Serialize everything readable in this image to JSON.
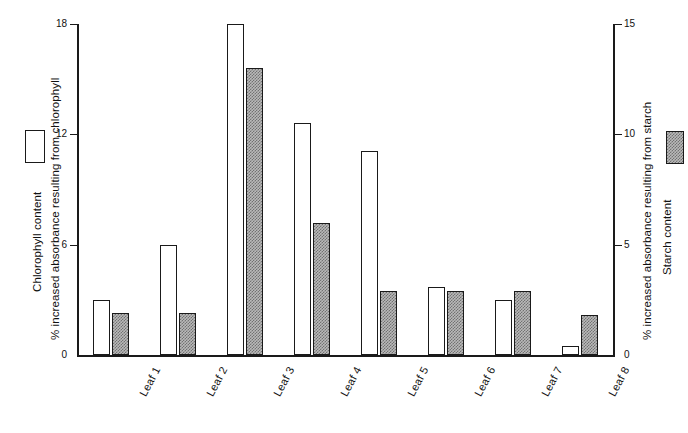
{
  "chart_data": {
    "type": "bar",
    "title": "",
    "categories": [
      "Leaf 1",
      "Leaf 2",
      "Leaf 3",
      "Leaf 4",
      "Leaf 5",
      "Leaf 6",
      "Leaf 7",
      "Leaf 8"
    ],
    "series": [
      {
        "name": "Chlorophyll content",
        "axis": "left",
        "style": "open-white-bar",
        "values": [
          3.0,
          6.0,
          18.0,
          12.6,
          11.1,
          3.7,
          3.0,
          0.5
        ]
      },
      {
        "name": "Starch content",
        "axis": "right",
        "style": "hatched-grey-bar",
        "values": [
          1.9,
          1.9,
          13.0,
          6.0,
          2.9,
          2.9,
          2.9,
          1.8
        ]
      }
    ],
    "xlabel": "",
    "ylabel": "% increased absorbance resulting from chlorophyll",
    "y2label": "% increased absorbance resulting from starch",
    "ylim": [
      0,
      18
    ],
    "y2lim": [
      0,
      15
    ],
    "yticks": [
      "0",
      "6",
      "12",
      "18"
    ],
    "ytick_values": [
      0,
      6,
      12,
      18
    ],
    "y2ticks": [
      "0",
      "5",
      "10",
      "15"
    ],
    "y2tick_values": [
      0,
      5,
      10,
      15
    ],
    "grid": false,
    "legend_position": "outside-left-and-right"
  },
  "axes": {
    "left": {
      "title": "% increased absorbance resulting from chlorophyll",
      "ticks": [
        "0",
        "6",
        "12",
        "18"
      ]
    },
    "right": {
      "title": "% increased absorbance resulting from starch",
      "ticks": [
        "0",
        "5",
        "10",
        "15"
      ]
    }
  },
  "legend": {
    "chlorophyll": {
      "label": "Chlorophyll content",
      "swatch": "open-white-bar"
    },
    "starch": {
      "label": "Starch content",
      "swatch": "hatched-grey-bar"
    }
  },
  "colors": {
    "axis": "#1a1a1a",
    "bar_outline": "#1a1a1a",
    "chlorophyll_fill": "#ffffff",
    "starch_fill": "#b9b9b9",
    "background": "#ffffff"
  }
}
